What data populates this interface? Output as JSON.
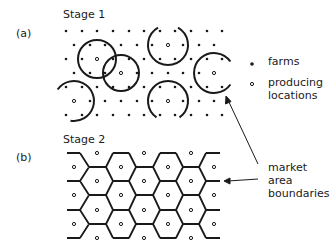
{
  "figure": {
    "panels": [
      {
        "id": "a",
        "label": "(a)",
        "title": "Stage 1"
      },
      {
        "id": "b",
        "label": "(b)",
        "title": "Stage 2"
      }
    ],
    "legend": {
      "farms": "farms",
      "producing_line1": "producing",
      "producing_line2": "locations"
    },
    "annotation": {
      "line1": "market",
      "line2": "area",
      "line3": "boundaries"
    },
    "stage1": {
      "row_y": [
        31,
        45,
        59,
        73,
        87,
        101,
        115
      ],
      "even_row_x": [
        66,
        82,
        97,
        113,
        129,
        144,
        160,
        175,
        191,
        207,
        222
      ],
      "odd_row_x": [
        74,
        90,
        105,
        121,
        137,
        152,
        168,
        183,
        199,
        214
      ],
      "producing_locations": [
        [
          97,
          59
        ],
        [
          121,
          73
        ],
        [
          168,
          45
        ],
        [
          214,
          73
        ],
        [
          74,
          101
        ],
        [
          168,
          101
        ]
      ],
      "market_circles": [
        {
          "cx": 97,
          "cy": 59,
          "r": 19,
          "arc": "full"
        },
        {
          "cx": 121,
          "cy": 73,
          "r": 18,
          "arc": "full"
        },
        {
          "cx": 168,
          "cy": 45,
          "r": 20,
          "arc": "open-top"
        },
        {
          "cx": 214,
          "cy": 73,
          "r": 20,
          "arc": "open-right"
        },
        {
          "cx": 74,
          "cy": 101,
          "r": 20,
          "arc": "open-left-bottom"
        },
        {
          "cx": 168,
          "cy": 101,
          "r": 20,
          "arc": "open-bottom"
        }
      ]
    },
    "stage2": {
      "producing_locations": [
        [
          97,
          153
        ],
        [
          144,
          153
        ],
        [
          191,
          153
        ],
        [
          74,
          167
        ],
        [
          121,
          167
        ],
        [
          168,
          167
        ],
        [
          214,
          167
        ],
        [
          97,
          181
        ],
        [
          144,
          181
        ],
        [
          191,
          181
        ],
        [
          74,
          195
        ],
        [
          121,
          195
        ],
        [
          168,
          195
        ],
        [
          214,
          195
        ],
        [
          97,
          210
        ],
        [
          144,
          210
        ],
        [
          191,
          210
        ],
        [
          74,
          224
        ],
        [
          121,
          224
        ],
        [
          168,
          224
        ],
        [
          214,
          224
        ],
        [
          97,
          238
        ],
        [
          144,
          238
        ],
        [
          191,
          238
        ]
      ]
    },
    "colors": {
      "ink": "#1a1a1a",
      "background": "#ffffff"
    }
  }
}
